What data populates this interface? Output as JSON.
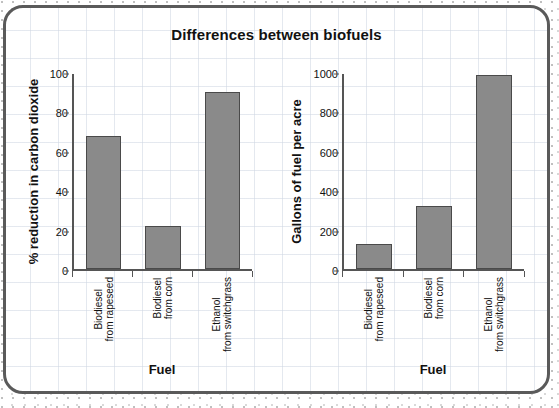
{
  "title": "Differences between biofuels",
  "charts": [
    {
      "id": "co2-reduction-chart",
      "ylabel": "% reduction in carbon dioxide",
      "xlabel": "Fuel",
      "yticks": [
        "100",
        "80",
        "60",
        "40",
        "20",
        "0"
      ],
      "categories": [
        {
          "line1": "Biodiesel",
          "line2": "from rapeseed"
        },
        {
          "line1": "Biodiesel",
          "line2": "from corn"
        },
        {
          "line1": "Ethanol",
          "line2": "from switchgrass"
        }
      ]
    },
    {
      "id": "gallons-per-acre-chart",
      "ylabel": "Gallons of fuel per acre",
      "xlabel": "Fuel",
      "yticks": [
        "1000",
        "800",
        "600",
        "400",
        "200",
        "0"
      ],
      "categories": [
        {
          "line1": "Biodiesel",
          "line2": "from rapeseed"
        },
        {
          "line1": "Biodiesel",
          "line2": "from corn"
        },
        {
          "line1": "Ethanol",
          "line2": "from switchgrass"
        }
      ]
    }
  ],
  "colors": {
    "bar_fill": "#8a8a8a",
    "bar_stroke": "#4a4a4a",
    "axis": "#555555",
    "text": "#111111",
    "card_border": "#5a5a5a",
    "grid": "#ced6e2"
  },
  "chart_data": [
    {
      "type": "bar",
      "title": "Differences between biofuels",
      "subtitle": "",
      "xlabel": "Fuel",
      "ylabel": "% reduction in carbon dioxide",
      "categories": [
        "Biodiesel from rapeseed",
        "Biodiesel from corn",
        "Ethanol from switchgrass"
      ],
      "values": [
        68,
        22,
        91
      ],
      "ylim": [
        0,
        100
      ],
      "ytick_values": [
        0,
        20,
        40,
        60,
        80,
        100
      ],
      "grid": false,
      "legend": "none"
    },
    {
      "type": "bar",
      "title": "Differences between biofuels",
      "subtitle": "",
      "xlabel": "Fuel",
      "ylabel": "Gallons of fuel per acre",
      "categories": [
        "Biodiesel from rapeseed",
        "Biodiesel from corn",
        "Ethanol from switchgrass"
      ],
      "values": [
        130,
        325,
        995
      ],
      "ylim": [
        0,
        1000
      ],
      "ytick_values": [
        0,
        200,
        400,
        600,
        800,
        1000
      ],
      "grid": false,
      "legend": "none"
    }
  ]
}
